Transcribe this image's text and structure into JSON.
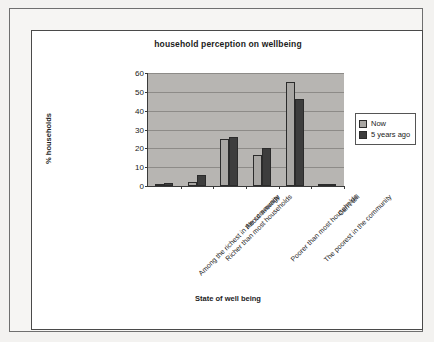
{
  "chart_data": {
    "type": "bar",
    "title": "household perception on wellbeing",
    "xlabel": "State of well being",
    "ylabel": "% households",
    "ylim": [
      0,
      60
    ],
    "ytick_values": [
      0,
      10,
      20,
      30,
      40,
      50,
      60
    ],
    "ytick_labels": [
      "0",
      "10",
      "20",
      "30",
      "40",
      "50",
      "60"
    ],
    "grid": true,
    "legend_position": "right",
    "categories": [
      "Among the richest in the community",
      "Richer than most households",
      "About average",
      "Poorer than most households",
      "The poorest in the community",
      "Can't tell"
    ],
    "series": [
      {
        "name": "Now",
        "color": "#a9a7a4",
        "values": [
          0.5,
          2,
          25,
          16.5,
          55,
          0.5
        ]
      },
      {
        "name": "5 years ago",
        "color": "#3d3d3d",
        "values": [
          1.5,
          6,
          26,
          20,
          46,
          1
        ]
      }
    ]
  },
  "legend": {
    "entries": [
      {
        "label": "Now",
        "swatch": "now"
      },
      {
        "label": "5 years ago",
        "swatch": "ago"
      }
    ]
  },
  "colors": {
    "plot_background": "#b7b5b2",
    "gridline": "#8d8b88",
    "axis": "#3a3a3a",
    "page_background": "#f3f2f0"
  }
}
